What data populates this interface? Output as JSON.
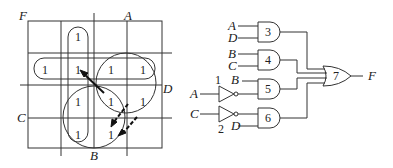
{
  "kmap": {
    "output_label": "F",
    "var_labels": {
      "A": "A",
      "B": "B",
      "C": "C",
      "D": "D"
    },
    "cells": [
      [
        "",
        "1",
        "",
        ""
      ],
      [
        "1",
        "1",
        "1",
        "1"
      ],
      [
        "",
        "1",
        "1",
        "1"
      ],
      [
        "",
        "1",
        "1",
        ""
      ]
    ],
    "one": "1"
  },
  "circuit": {
    "gates": [
      {
        "id": "3",
        "type": "AND",
        "inputs": [
          "A",
          "D"
        ]
      },
      {
        "id": "4",
        "type": "AND",
        "inputs": [
          "B",
          "C"
        ]
      },
      {
        "id": "5",
        "type": "AND",
        "inputs": [
          "B",
          "A'"
        ]
      },
      {
        "id": "6",
        "type": "AND",
        "inputs": [
          "C'",
          "D"
        ]
      },
      {
        "id": "7",
        "type": "OR",
        "inputs": [
          "3",
          "4",
          "5",
          "6"
        ]
      }
    ],
    "inverters": [
      {
        "id": "1",
        "input": "A"
      },
      {
        "id": "2",
        "input": "C"
      }
    ],
    "labels": {
      "g3a": "A",
      "g3b": "D",
      "g4a": "B",
      "g4b": "C",
      "g5a": "B",
      "inv1_in": "A",
      "inv2_in": "C",
      "g6b": "D",
      "inv1_num": "1",
      "inv2_num": "2",
      "g3": "3",
      "g4": "4",
      "g5": "5",
      "g6": "6",
      "g7": "7",
      "out": "F"
    }
  }
}
